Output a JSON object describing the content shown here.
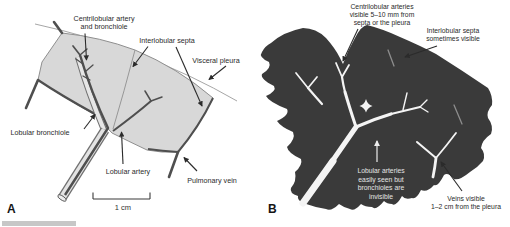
{
  "figure": {
    "panel_a_letter": "A",
    "panel_b_letter": "B",
    "scale_bar_label": "1 cm"
  },
  "panel_a": {
    "labels": {
      "centrilobular": {
        "l1": "Centrilobular artery",
        "l2": "and bronchiole"
      },
      "interlobular_septa": "Interlobular septa",
      "visceral_pleura": "Visceral pleura",
      "lobular_bronchiole": "Lobular bronchiole",
      "lobular_artery": "Lobular artery",
      "pulmonary_vein": "Pulmonary vein"
    }
  },
  "panel_b": {
    "labels": {
      "centrilobular_arteries": {
        "l1": "Centrilobular arteries",
        "l2": "visible 5–10 mm from",
        "l3": "septa or the pleura"
      },
      "interlobular_septa": {
        "l1": "Interlobular septa",
        "l2": "sometimes visible"
      },
      "lobular_arteries": {
        "l1": "Lobular arteries",
        "l2": "easily seen but",
        "l3": "bronchioles are",
        "l4": "invisible"
      },
      "veins": {
        "l1": "Veins visible",
        "l2": "1–2 cm from the pleura"
      }
    }
  },
  "colors": {
    "background": "#ffffff",
    "lobule_fill": "#d8d8d8",
    "lobule_outline": "#8f8f8f",
    "vessel_dark": "#4f4f4f",
    "bronchiole_fill": "#e6e6e6",
    "blob_fill": "#3a3a3a",
    "vessel_white": "#f4f4f4",
    "label_text": "#2b2b2b",
    "label_text_light": "#e4e4e4",
    "bottom_bar": "#c7c7c7"
  }
}
